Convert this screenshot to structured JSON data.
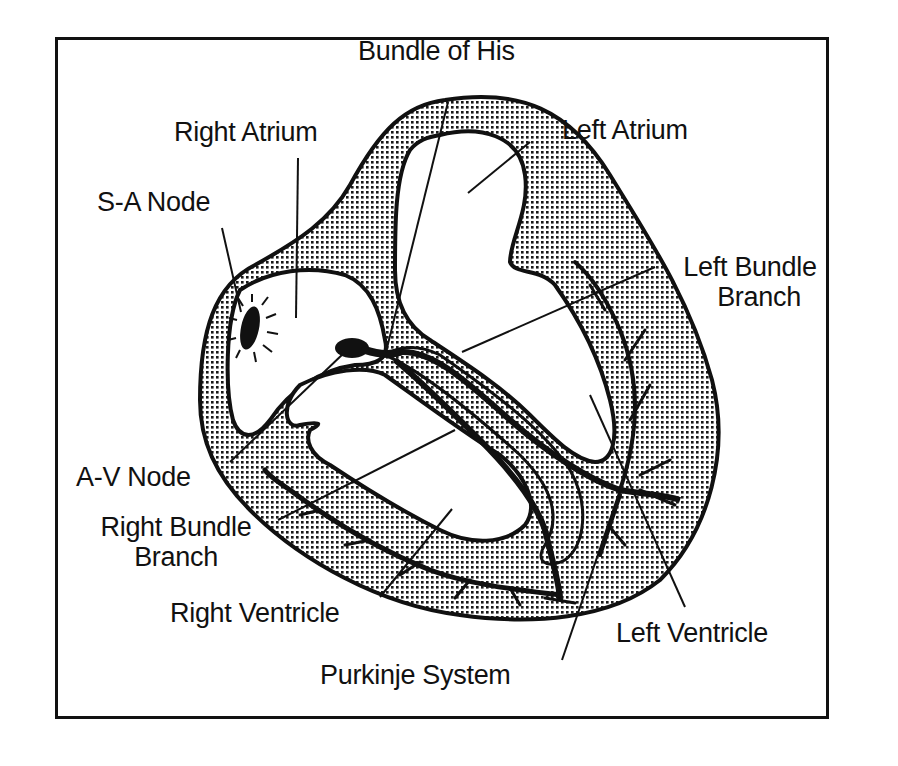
{
  "diagram": {
    "colors": {
      "ink": "#111111",
      "background": "#ffffff",
      "myocardium_dots": "#1a1a1a"
    },
    "labels": {
      "bundle_of_his": "Bundle of His",
      "right_atrium": "Right Atrium",
      "left_atrium": "Left Atrium",
      "sa_node": "S-A Node",
      "left_bundle_branch_line1": "Left Bundle",
      "left_bundle_branch_line2": "Branch",
      "av_node": "A-V Node",
      "right_bundle_branch_line1": "Right Bundle",
      "right_bundle_branch_line2": "Branch",
      "right_ventricle": "Right Ventricle",
      "left_ventricle": "Left Ventricle",
      "purkinje_system": "Purkinje System"
    },
    "structures": [
      "Heart wall (myocardium)",
      "Right Atrium chamber",
      "Left Atrium chamber",
      "Right Ventricle chamber",
      "Left Ventricle chamber",
      "S-A Node",
      "A-V Node",
      "Bundle of His",
      "Left Bundle Branch",
      "Right Bundle Branch",
      "Purkinje fibers"
    ]
  }
}
